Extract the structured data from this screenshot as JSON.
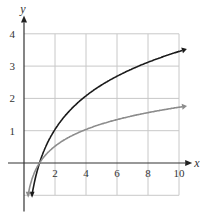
{
  "chart_data": {
    "type": "line",
    "title": "",
    "xlabel": "x",
    "ylabel": "y",
    "xlim": [
      -1,
      10
    ],
    "ylim": [
      -1,
      4
    ],
    "grid": true,
    "x_ticks": [
      "2",
      "4",
      "6",
      "8",
      "10"
    ],
    "y_ticks": [
      "1",
      "2",
      "3",
      "4"
    ],
    "series": [
      {
        "name": "black curve",
        "color": "#1a1a1a",
        "x": [
          0.5,
          1,
          2,
          4,
          6,
          8,
          10
        ],
        "values": [
          -1.0,
          0,
          1.04,
          2.08,
          2.69,
          3.12,
          3.45
        ]
      },
      {
        "name": "gray curve",
        "color": "#888888",
        "x": [
          0.27,
          1,
          2,
          4,
          6,
          8,
          10
        ],
        "values": [
          -1.0,
          0,
          0.52,
          1.04,
          1.34,
          1.56,
          1.73
        ]
      }
    ]
  }
}
